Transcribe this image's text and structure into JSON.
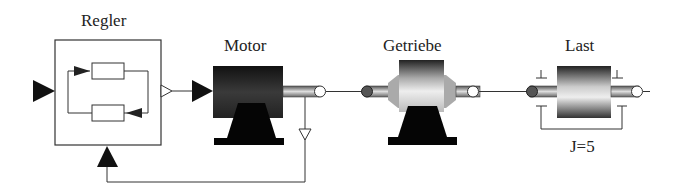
{
  "diagram": {
    "blocks": [
      {
        "id": "regler",
        "label": "Regler"
      },
      {
        "id": "motor",
        "label": "Motor"
      },
      {
        "id": "getriebe",
        "label": "Getriebe"
      },
      {
        "id": "last",
        "label": "Last",
        "parameter": "J=5"
      }
    ],
    "connections": [
      {
        "from": "input",
        "to": "regler"
      },
      {
        "from": "regler",
        "to": "motor"
      },
      {
        "from": "motor",
        "to": "getriebe"
      },
      {
        "from": "getriebe",
        "to": "last"
      },
      {
        "from": "motor",
        "to": "regler",
        "type": "feedback"
      }
    ],
    "colors": {
      "line": "#333333",
      "fill_dark": "#111111",
      "background": "#ffffff"
    }
  }
}
